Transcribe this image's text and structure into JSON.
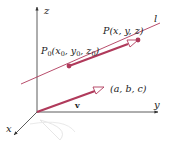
{
  "diagram": {
    "axes": {
      "x_label": "x",
      "y_label": "y",
      "z_label": "z"
    },
    "line": {
      "label": "l",
      "color": "#b03a5b"
    },
    "points": {
      "p0_label": "P",
      "p0_sub": "0",
      "p0_coords_open": "(x",
      "p0_sub_x": "0",
      "p0_comma_y": ", y",
      "p0_sub_y": "0",
      "p0_comma_z": ", z",
      "p0_sub_z": "0",
      "p0_close": ")",
      "p_label": "P(x, y, z)"
    },
    "vector": {
      "label": "v",
      "components": "(a, b, c)",
      "color": "#b03a5b"
    },
    "axis_color": "#333333"
  }
}
